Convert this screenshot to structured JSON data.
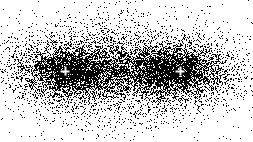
{
  "figure": {
    "width": 253,
    "height": 142,
    "background_color": "#ffffff",
    "ink_color": "#000000",
    "render_style": "stipple",
    "title": ""
  },
  "chart_data": {
    "type": "scatter",
    "title": "",
    "subtitle": "",
    "xlabel": "",
    "ylabel": "",
    "xlim": [
      0,
      253
    ],
    "ylim": [
      0,
      142
    ],
    "grid": false,
    "legend": null,
    "axes_visible": false,
    "tick_labels_x": [],
    "tick_labels_y": [],
    "point_color": "#000000",
    "background_color": "#ffffff",
    "density_model": "sum of two anisotropic gaussians plus a broad shared halo, rendered as random black dots",
    "density_peak_y": 71,
    "total_points_approx": 26000,
    "series": [
      {
        "name": "left-lobe",
        "center_x": 65,
        "center_y": 71,
        "sigma_x": 34,
        "sigma_y": 17,
        "weight": 1.0,
        "peak_density": 0.92
      },
      {
        "name": "right-lobe",
        "center_x": 180,
        "center_y": 71,
        "sigma_x": 34,
        "sigma_y": 17,
        "weight": 1.0,
        "peak_density": 0.92
      },
      {
        "name": "shared-halo",
        "center_x": 123,
        "center_y": 71,
        "sigma_x": 66,
        "sigma_y": 33,
        "weight": 0.85,
        "peak_density": 0.55
      }
    ],
    "markers": [
      {
        "label": "focus-left",
        "x": 65,
        "y": 71,
        "glyph": "plus",
        "color": "#ffffff",
        "size": 9
      },
      {
        "label": "focus-right",
        "x": 180,
        "y": 71,
        "glyph": "plus",
        "color": "#ffffff",
        "size": 9
      }
    ]
  }
}
